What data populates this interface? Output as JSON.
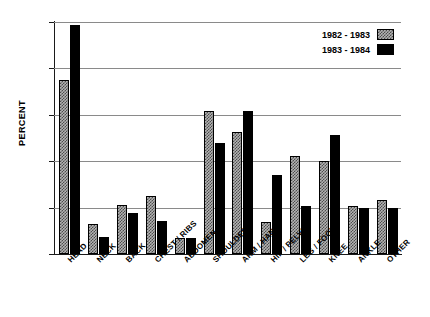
{
  "chart_data": {
    "type": "bar",
    "title": "",
    "xlabel": "",
    "ylabel": "PERCENT",
    "ylim": [
      0,
      25
    ],
    "yticks": [
      0,
      5,
      10,
      15,
      20,
      25
    ],
    "ytick_labels": [
      "0",
      "5",
      "10",
      "15",
      "20",
      "25"
    ],
    "grid": true,
    "legend_position": "top-right",
    "categories": [
      "HEAD",
      "NECK",
      "BACK",
      "CHEST / RIBS",
      "ABDOMEN",
      "SHOULDER",
      "ARM / HAND",
      "HIP / PELVIS",
      "LEG / FOOT",
      "KNEE",
      "ANKLE",
      "OTHER"
    ],
    "series": [
      {
        "name": "1982 - 1983",
        "pattern": "hatched-gray",
        "color": "#b3b3b3",
        "values": [
          18.7,
          3.2,
          5.3,
          6.2,
          1.7,
          15.4,
          13.1,
          3.5,
          10.6,
          10.0,
          5.2,
          5.8
        ]
      },
      {
        "name": "1983 - 1984",
        "pattern": "solid-black",
        "color": "#000000",
        "values": [
          24.7,
          1.8,
          4.4,
          3.6,
          1.7,
          12.0,
          15.4,
          8.5,
          5.2,
          12.8,
          5.0,
          5.0
        ]
      }
    ]
  },
  "legend": {
    "entries": [
      {
        "label": "1982 - 1983"
      },
      {
        "label": "1983 - 1984"
      }
    ]
  }
}
